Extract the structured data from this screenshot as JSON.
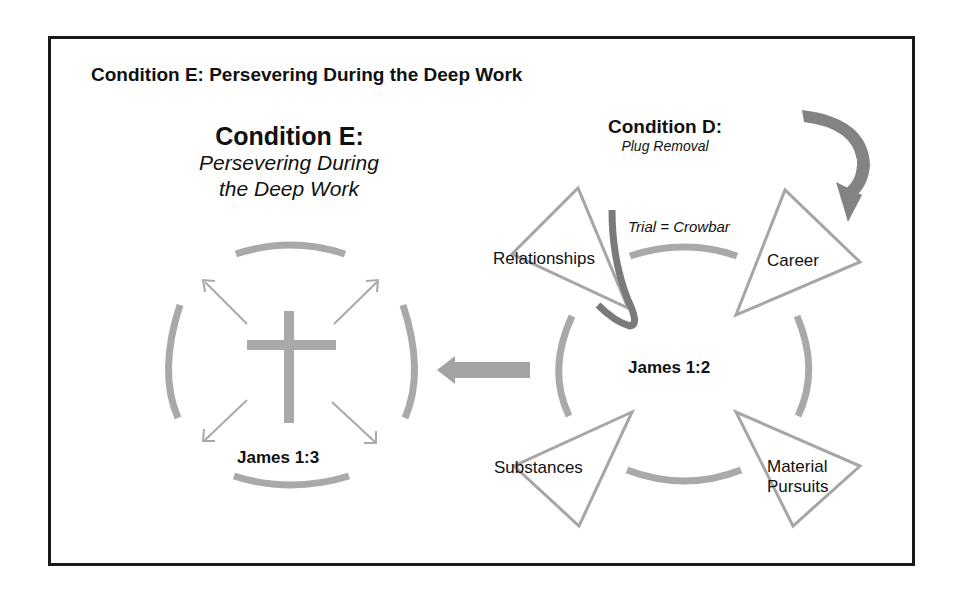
{
  "header": {
    "title": "Condition E: Persevering During the Deep Work"
  },
  "condition_e": {
    "title": "Condition E:",
    "subtitle_line1": "Persevering During",
    "subtitle_line2": "the Deep Work",
    "verse": "James 1:3",
    "center_icon": "cross-icon"
  },
  "condition_d": {
    "title": "Condition D:",
    "subtitle": "Plug Removal",
    "verse": "James 1:2",
    "tool_label": "Trial = Crowbar",
    "plugs": [
      {
        "label": "Relationships"
      },
      {
        "label": "Career"
      },
      {
        "label": "Substances"
      },
      {
        "label": "Material Pursuits",
        "line1": "Material",
        "line2": "Pursuits"
      }
    ]
  },
  "colors": {
    "frame": "#1a1a1a",
    "ring": "#a9a9a9",
    "arrow_dark": "#7d7d7d",
    "triangle": "#a6a6a6",
    "text": "#111111"
  }
}
